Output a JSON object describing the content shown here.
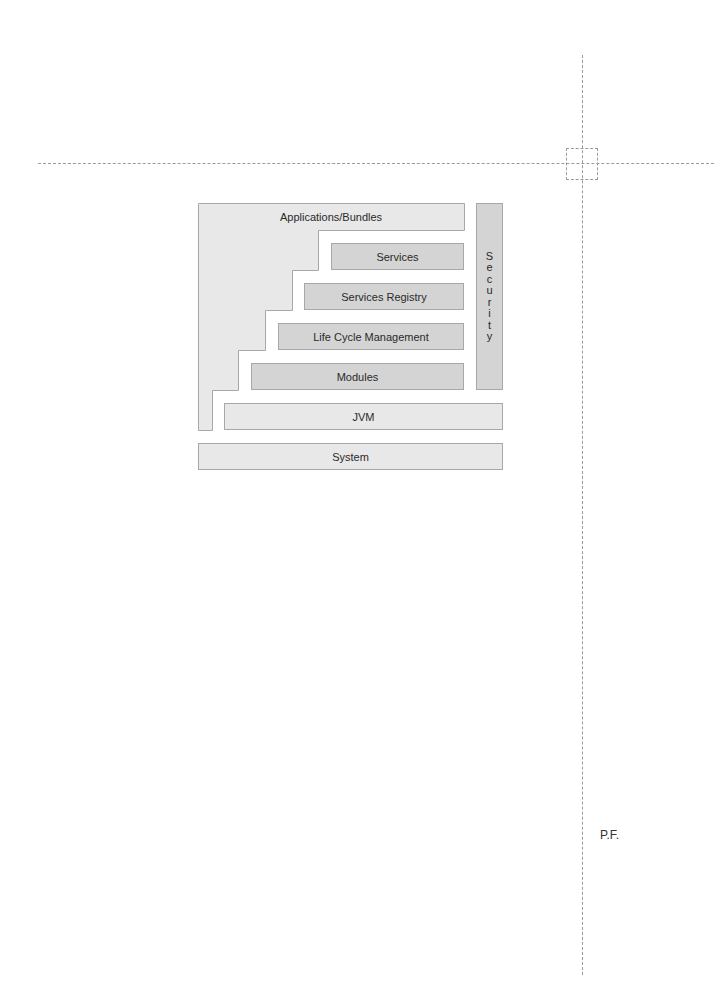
{
  "diagram": {
    "top_bar_label": "Applications/Bundles",
    "layers": [
      {
        "id": "services",
        "label": "Services"
      },
      {
        "id": "services-registry",
        "label": "Services Registry"
      },
      {
        "id": "life-cycle",
        "label": "Life Cycle Management"
      },
      {
        "id": "modules",
        "label": "Modules"
      },
      {
        "id": "jvm",
        "label": "JVM"
      },
      {
        "id": "system",
        "label": "System"
      }
    ],
    "side_column": {
      "label": "Security",
      "letters": [
        "S",
        "e",
        "c",
        "u",
        "r",
        "i",
        "t",
        "y"
      ]
    },
    "colors": {
      "light_fill": "#e8e8e8",
      "dark_fill": "#d4d4d4",
      "border": "#a8a8a8",
      "crop_marks": "#9a9a9a"
    }
  },
  "page_mark": "P.F."
}
